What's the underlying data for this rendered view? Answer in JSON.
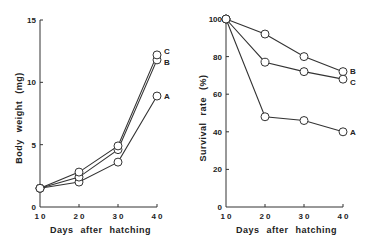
{
  "chart_data": [
    {
      "type": "line",
      "title": "",
      "xlabel": "Days after hatching",
      "ylabel": "Body weight (mg)",
      "x": [
        10,
        20,
        30,
        40
      ],
      "x_tick_labels": [
        "1 0",
        "2 0",
        "3 0",
        "4 0"
      ],
      "y_ticks": [
        0,
        5,
        10,
        15
      ],
      "y_tick_labels": [
        "0",
        "5",
        "10",
        "15"
      ],
      "ylim": [
        0,
        15
      ],
      "xlim": [
        10,
        40
      ],
      "grid": false,
      "legend_position": "inline-right",
      "marker": "open-circle",
      "series": [
        {
          "name": "A",
          "values": [
            1.5,
            2.0,
            3.6,
            8.9
          ]
        },
        {
          "name": "B",
          "values": [
            1.5,
            2.4,
            4.6,
            11.8
          ]
        },
        {
          "name": "C",
          "values": [
            1.5,
            2.8,
            4.9,
            12.2
          ]
        }
      ]
    },
    {
      "type": "line",
      "title": "",
      "xlabel": "Days after hatching",
      "ylabel": "Survival rate (%)",
      "x": [
        10,
        20,
        30,
        40
      ],
      "x_tick_labels": [
        "1 0",
        "2 0",
        "3 0",
        "4 0"
      ],
      "y_ticks": [
        0,
        20,
        40,
        60,
        80,
        100
      ],
      "y_tick_labels": [
        "0",
        "20",
        "40",
        "60",
        "80",
        "100"
      ],
      "ylim": [
        0,
        100
      ],
      "xlim": [
        10,
        40
      ],
      "grid": false,
      "legend_position": "inline-right",
      "marker": "open-circle",
      "series": [
        {
          "name": "A",
          "values": [
            100,
            48,
            46,
            40
          ]
        },
        {
          "name": "B",
          "values": [
            100,
            92,
            80,
            72
          ]
        },
        {
          "name": "C",
          "values": [
            100,
            77,
            72,
            68
          ]
        }
      ]
    }
  ],
  "left": {
    "xlabel": "Days after hatching",
    "ylabel": "Body weight (mg)"
  },
  "right": {
    "xlabel": "Days after hatching",
    "ylabel": "Survival rate (%)"
  }
}
